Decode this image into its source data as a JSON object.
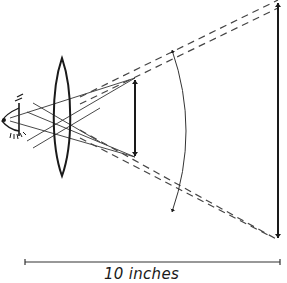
{
  "figure": {
    "type": "magnifier-optics-diagram",
    "scale_label": "10 inches",
    "colors": {
      "ink": "#1a1a1a",
      "dash": "#333333",
      "background": "#ffffff"
    },
    "elements": {
      "eye": "eye-icon",
      "lens": "convex-lens",
      "object_arrow": "small double-headed arrow (object)",
      "image_arrow": "large double-headed arrow (virtual image)",
      "angle_arc": "arc indicating angular size",
      "scale_bar": "horizontal distance bar"
    }
  }
}
